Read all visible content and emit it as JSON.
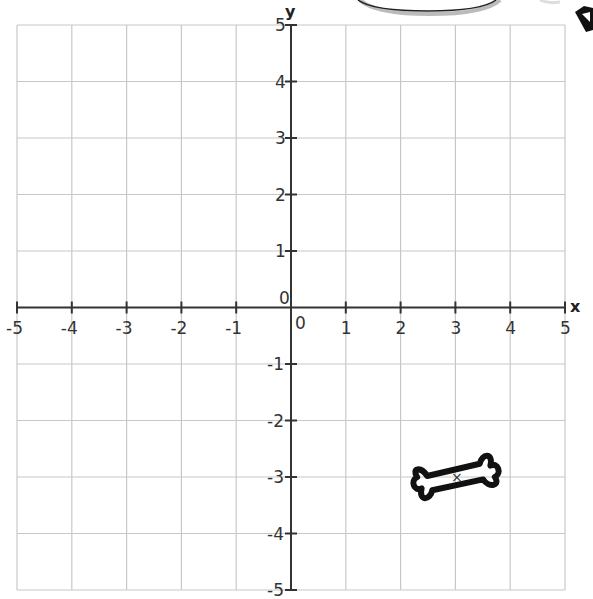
{
  "chart_data": {
    "type": "coordinate-grid",
    "xlabel": "x",
    "ylabel": "y",
    "xlim": [
      -5,
      5
    ],
    "ylim": [
      -5,
      5
    ],
    "x_ticks": [
      "-5",
      "-4",
      "-3",
      "-2",
      "-1",
      "0",
      "1",
      "2",
      "3",
      "4",
      "5"
    ],
    "y_ticks": [
      "5",
      "4",
      "3",
      "2",
      "1",
      "0",
      "-1",
      "-2",
      "-3",
      "-4",
      "-5"
    ],
    "origin_label": "0",
    "grid": true,
    "shapes": [
      {
        "name": "bone",
        "center": [
          3,
          -3
        ],
        "marker": "×"
      }
    ]
  },
  "labels": {
    "x_axis": "x",
    "y_axis": "y",
    "origin": "0"
  }
}
